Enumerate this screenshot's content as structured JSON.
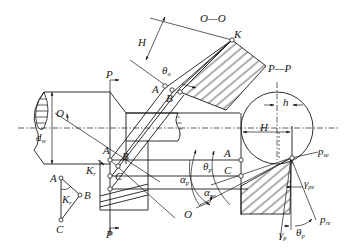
{
  "diagram": {
    "section_labels": {
      "oo": "O—O",
      "pp": "P—P"
    },
    "labels": {
      "K": "K",
      "H_top": "H",
      "theta_o": "θ",
      "theta_o_sub": "o",
      "A_top": "A",
      "B_top": "B",
      "P_top": "P",
      "P_bottom": "P",
      "O_left": "O",
      "O_bottom": "O",
      "d_w": "d",
      "d_w_sub": "w",
      "A_mid": "A",
      "B_mid": "B",
      "C_mid": "C",
      "kappa_r": "K",
      "kappa_r_sub": "r",
      "tri_A": "A",
      "tri_B": "B",
      "tri_C": "C",
      "tri_kappa": "K",
      "tri_kappa_sub": "r",
      "h": "h",
      "H_right": "H",
      "A_right": "A",
      "C_right": "C",
      "theta_p": "θ",
      "theta_p_sub": "p",
      "alpha_p": "α",
      "alpha_p_sub": "p",
      "alpha_pe": "α",
      "alpha_pe_sub": "pe",
      "p_se": "p",
      "p_se_sub": "se",
      "gamma_pe": "γ",
      "gamma_pe_sub": "pe",
      "p_re": "p",
      "p_re_sub": "re",
      "gamma_p": "γ",
      "gamma_p_sub": "p",
      "theta_p2": "θ",
      "theta_p2_sub": "p"
    }
  }
}
